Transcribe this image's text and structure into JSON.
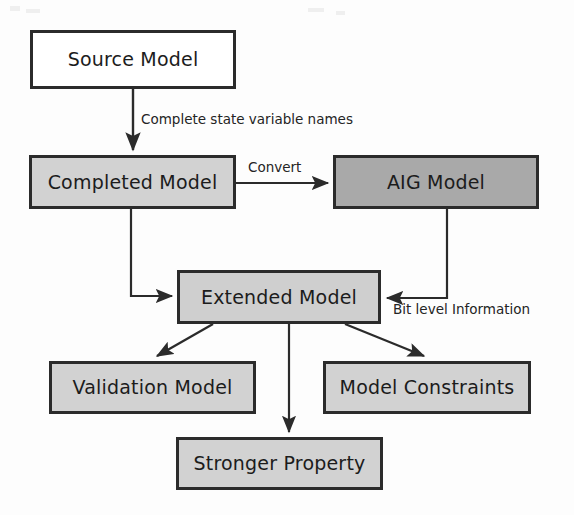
{
  "diagram": {
    "type": "flowchart",
    "canvas": {
      "width": 574,
      "height": 515
    },
    "colors": {
      "stroke": "#2b2b2b",
      "text": "#1c1c1c",
      "fill_white": "#ffffff",
      "fill_light_gray": "#d2d2d2",
      "fill_mid_gray": "#cfcfcf",
      "fill_dark_gray": "#a9a9a9",
      "background": "#fdfdfd"
    },
    "nodes": [
      {
        "id": "source-model",
        "label": "Source Model",
        "fill": "white",
        "x": 30,
        "y": 30,
        "w": 206,
        "h": 59
      },
      {
        "id": "completed-model",
        "label": "Completed Model",
        "fill": "light",
        "x": 29,
        "y": 155,
        "w": 207,
        "h": 54
      },
      {
        "id": "aig-model",
        "label": "AIG Model",
        "fill": "dark",
        "x": 333,
        "y": 155,
        "w": 206,
        "h": 54
      },
      {
        "id": "extended-model",
        "label": "Extended Model",
        "fill": "mid",
        "x": 177,
        "y": 270,
        "w": 204,
        "h": 54
      },
      {
        "id": "validation-model",
        "label": "Validation Model",
        "fill": "light",
        "x": 49,
        "y": 361,
        "w": 207,
        "h": 53
      },
      {
        "id": "model-constraints",
        "label": "Model Constraints",
        "fill": "light",
        "x": 323,
        "y": 361,
        "w": 208,
        "h": 53
      },
      {
        "id": "stronger-property",
        "label": "Stronger Property",
        "fill": "light",
        "x": 176,
        "y": 437,
        "w": 207,
        "h": 53
      }
    ],
    "edges": [
      {
        "id": "source-to-completed",
        "from": "source-model",
        "to": "completed-model",
        "label": "Complete state variable names",
        "style": "vertical-arrow"
      },
      {
        "id": "completed-to-aig",
        "from": "completed-model",
        "to": "aig-model",
        "label": "Convert",
        "style": "horizontal-arrow"
      },
      {
        "id": "completed-to-extended",
        "from": "completed-model",
        "to": "extended-model",
        "label": "",
        "style": "elbow-arrow"
      },
      {
        "id": "aig-to-extended",
        "from": "aig-model",
        "to": "extended-model",
        "label": "Bit level Information",
        "style": "elbow-arrow"
      },
      {
        "id": "extended-to-validation",
        "from": "extended-model",
        "to": "validation-model",
        "label": "",
        "style": "diagonal-arrow"
      },
      {
        "id": "extended-to-constraints",
        "from": "extended-model",
        "to": "model-constraints",
        "label": "",
        "style": "diagonal-arrow"
      },
      {
        "id": "extended-to-stronger",
        "from": "extended-model",
        "to": "stronger-property",
        "label": "",
        "style": "vertical-arrow"
      }
    ],
    "edge_labels": {
      "complete_state_variable_names": "Complete state variable names",
      "convert": "Convert",
      "bit_level_information": "Bit level Information"
    }
  }
}
